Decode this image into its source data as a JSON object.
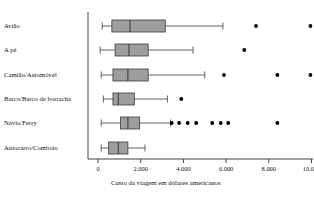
{
  "chart_data": {
    "type": "box",
    "title": "",
    "xlabel": "Custo da viagem em dólares americanos",
    "ylabel": "",
    "xlim": [
      -200,
      11400
    ],
    "xticks": [
      0,
      2000,
      4000,
      6000,
      8000,
      10000
    ],
    "xtick_labels": [
      "0",
      "2.000",
      "4.000",
      "6.000",
      "8.000",
      "10.000"
    ],
    "grid": false,
    "legend": "none",
    "orientation": "horizontal",
    "box_fill": "#9e9e9e",
    "box_edge": "#3a3a3a",
    "outlier_color": "#000000",
    "axis_color": "#444444",
    "categories": [
      "Avião",
      "A pé",
      "Camião/Automóvel",
      "Barco/Barco de borracha",
      "Navio/Ferry",
      "Autocarro/Comboio"
    ],
    "boxes": [
      {
        "category": "Avião",
        "whisker_low": 200,
        "q1": 650,
        "median": 1500,
        "q3": 3150,
        "whisker_high": 5850,
        "outliers": [
          7400,
          9950,
          10950
        ]
      },
      {
        "category": "A pé",
        "whisker_low": 100,
        "q1": 800,
        "median": 1450,
        "q3": 2350,
        "whisker_high": 4450,
        "outliers": [
          6850
        ]
      },
      {
        "category": "Camião/Automóvel",
        "whisker_low": 150,
        "q1": 700,
        "median": 1400,
        "q3": 2350,
        "whisker_high": 5000,
        "outliers": [
          5900,
          8400,
          9950
        ]
      },
      {
        "category": "Barco/Barco de borracha",
        "whisker_low": 250,
        "q1": 700,
        "median": 950,
        "q3": 1700,
        "whisker_high": 3250,
        "outliers": [
          3900
        ]
      },
      {
        "category": "Navio/Ferry",
        "whisker_low": 150,
        "q1": 1050,
        "median": 1400,
        "q3": 1950,
        "whisker_high": 3400,
        "outliers": [
          3450,
          3800,
          4200,
          4600,
          5350,
          5750,
          6100,
          8400
        ]
      },
      {
        "category": "Autocarro/Comboio",
        "whisker_low": 150,
        "q1": 500,
        "median": 950,
        "q3": 1400,
        "whisker_high": 2200,
        "outliers": []
      }
    ]
  }
}
